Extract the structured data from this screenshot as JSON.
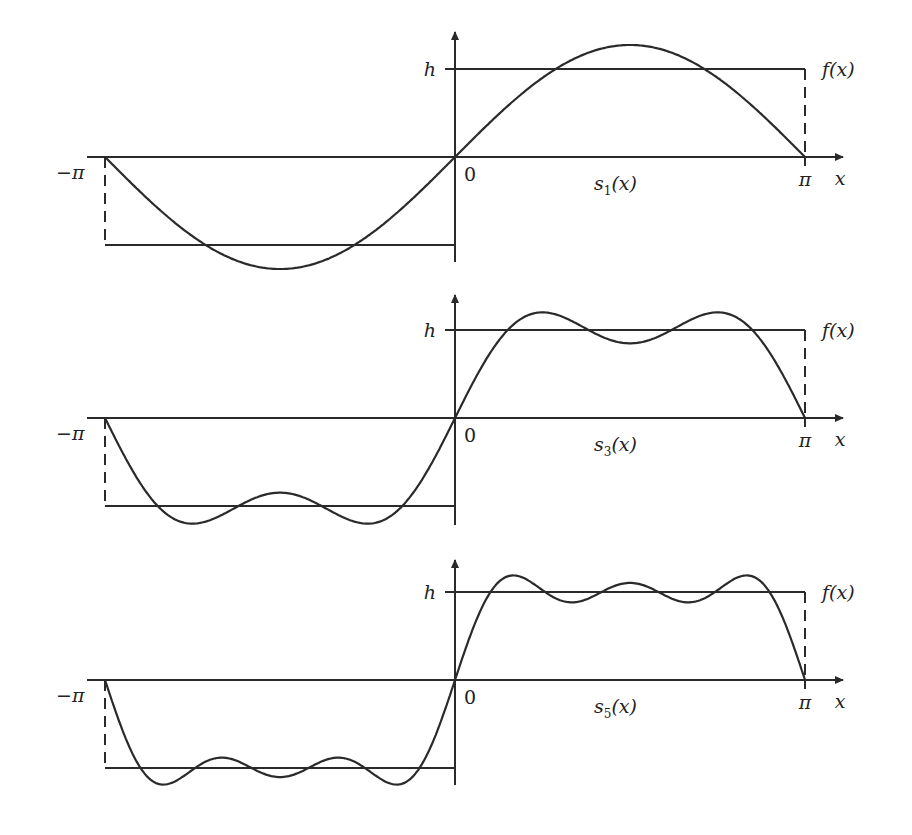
{
  "figure": {
    "panels": [
      {
        "id": "s1",
        "curve_label_main": "s",
        "curve_label_sub": "1",
        "curve_label_tail": "(x)",
        "n_max": 1
      },
      {
        "id": "s3",
        "curve_label_main": "s",
        "curve_label_sub": "3",
        "curve_label_tail": "(x)",
        "n_max": 3
      },
      {
        "id": "s5",
        "curve_label_main": "s",
        "curve_label_sub": "5",
        "curve_label_tail": "(x)",
        "n_max": 5
      }
    ],
    "labels": {
      "h": "h",
      "minus_pi": "−π",
      "pi": "π",
      "zero": "0",
      "x": "x",
      "f": "f(x)"
    },
    "colors": {
      "ink": "#2a2a2a",
      "background": "#ffffff"
    }
  },
  "chart_data": [
    {
      "type": "line",
      "title": "",
      "xlabel": "x",
      "ylabel": "",
      "x_ticks": [
        "−π",
        "0",
        "π"
      ],
      "y_ticks": [
        "h"
      ],
      "xlim": [
        -3.1416,
        3.1416
      ],
      "ylim": [
        -1.3,
        1.3
      ],
      "grid": false,
      "legend": "none",
      "series": [
        {
          "name": "f(x)",
          "kind": "square wave",
          "x": [
            -3.1416,
            0,
            0,
            3.1416
          ],
          "values": [
            -1,
            -1,
            1,
            1
          ]
        },
        {
          "name": "s1(x)",
          "kind": "partial sum",
          "formula": "(4h/π) sin x",
          "peak": 1.27,
          "x_peak": 1.5708
        }
      ]
    },
    {
      "type": "line",
      "title": "",
      "xlabel": "x",
      "ylabel": "",
      "x_ticks": [
        "−π",
        "0",
        "π"
      ],
      "y_ticks": [
        "h"
      ],
      "xlim": [
        -3.1416,
        3.1416
      ],
      "ylim": [
        -1.3,
        1.3
      ],
      "grid": false,
      "legend": "none",
      "series": [
        {
          "name": "f(x)",
          "kind": "square wave",
          "x": [
            -3.1416,
            0,
            0,
            3.1416
          ],
          "values": [
            -1,
            -1,
            1,
            1
          ]
        },
        {
          "name": "s3(x)",
          "kind": "partial sum",
          "formula": "(4h/π)(sin x + sin 3x / 3)",
          "peaks": [
            1.18,
            1.18
          ],
          "x_peaks": [
            0.785,
            2.356
          ],
          "mid_dip": 0.85
        }
      ]
    },
    {
      "type": "line",
      "title": "",
      "xlabel": "x",
      "ylabel": "",
      "x_ticks": [
        "−π",
        "0",
        "π"
      ],
      "y_ticks": [
        "h"
      ],
      "xlim": [
        -3.1416,
        3.1416
      ],
      "ylim": [
        -1.3,
        1.3
      ],
      "grid": false,
      "legend": "none",
      "series": [
        {
          "name": "f(x)",
          "kind": "square wave",
          "x": [
            -3.1416,
            0,
            0,
            3.1416
          ],
          "values": [
            -1,
            -1,
            1,
            1
          ]
        },
        {
          "name": "s5(x)",
          "kind": "partial sum",
          "formula": "(4h/π)(sin x + sin 3x / 3 + sin 5x / 5)",
          "peaks": [
            1.16,
            1.07,
            1.16
          ],
          "dips": [
            0.9,
            0.9
          ]
        }
      ]
    }
  ]
}
